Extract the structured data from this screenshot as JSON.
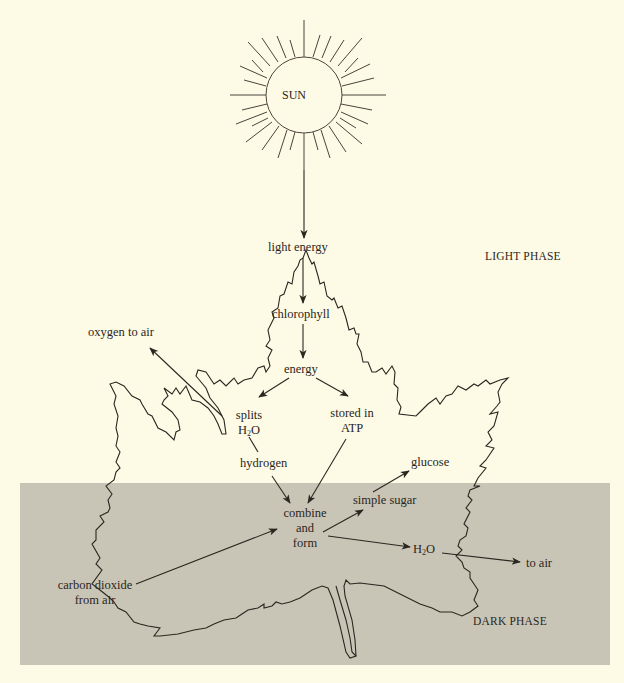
{
  "diagram": {
    "type": "photosynthesis-flow",
    "colors": {
      "background": "#fdfbe6",
      "dark_phase_band": "#c9c5b6",
      "ink": "#2b2620"
    },
    "sun": {
      "label": "SUN"
    },
    "phases": {
      "light": "LIGHT PHASE",
      "dark": "DARK PHASE"
    },
    "nodes": {
      "light_energy": "light energy",
      "chlorophyll": "chlorophyll",
      "energy": "energy",
      "oxygen_to_air": "oxygen to air",
      "splits_line1": "splits",
      "splits_h": "H",
      "splits_sub": "2",
      "splits_o": "O",
      "stored_line1": "stored in",
      "stored_line2": "ATP",
      "hydrogen": "hydrogen",
      "glucose": "glucose",
      "simple_sugar": "simple sugar",
      "combine_line1": "combine",
      "combine_line2": "and",
      "combine_line3": "form",
      "water_h": "H",
      "water_sub": "2",
      "water_o": "O",
      "to_air": "to air",
      "co2_line1": "carbon dioxide",
      "co2_line2": "from air"
    },
    "edges": [
      {
        "from": "SUN",
        "to": "light energy"
      },
      {
        "from": "light energy",
        "to": "chlorophyll"
      },
      {
        "from": "chlorophyll",
        "to": "energy"
      },
      {
        "from": "energy",
        "to": "splits H2O"
      },
      {
        "from": "energy",
        "to": "stored in ATP"
      },
      {
        "from": "splits H2O",
        "to": "oxygen to air"
      },
      {
        "from": "splits H2O",
        "to": "hydrogen"
      },
      {
        "from": "hydrogen",
        "to": "combine and form"
      },
      {
        "from": "stored in ATP",
        "to": "combine and form"
      },
      {
        "from": "carbon dioxide from air",
        "to": "combine and form"
      },
      {
        "from": "combine and form",
        "to": "simple sugar"
      },
      {
        "from": "simple sugar",
        "to": "glucose"
      },
      {
        "from": "combine and form",
        "to": "H2O"
      },
      {
        "from": "H2O",
        "to": "to air"
      }
    ]
  }
}
